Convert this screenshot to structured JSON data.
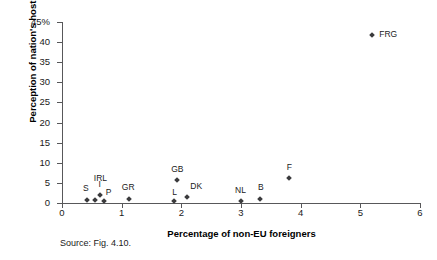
{
  "source_note": "Source: Fig. 4.10.",
  "chart_data": {
    "type": "scatter",
    "title": "",
    "xlabel": "Percentage of non-EU foreigners",
    "ylabel": "Perception of nation's hostility",
    "xlim": [
      0,
      6
    ],
    "ylim": [
      0,
      45
    ],
    "xticks": [
      "0",
      "1",
      "2",
      "3",
      "4",
      "5",
      "6"
    ],
    "yticks": [
      "0",
      "5",
      "10",
      "15",
      "20",
      "25",
      "30",
      "35",
      "40",
      "45%"
    ],
    "grid": false,
    "legend": "none",
    "marker_color": "#3a3a3c",
    "axis_color": "#58585a",
    "points": [
      {
        "label": "S",
        "x": 0.42,
        "y": 0.7,
        "label_dx": -4,
        "label_dy": -16
      },
      {
        "label": "IRL",
        "x": 0.55,
        "y": 0.8,
        "label_dx": -1,
        "label_dy": -26
      },
      {
        "label": "I",
        "x": 0.63,
        "y": 2.0,
        "label_dx": -1,
        "label_dy": -15
      },
      {
        "label": "P",
        "x": 0.7,
        "y": 0.4,
        "label_dx": 2,
        "label_dy": -13
      },
      {
        "label": "GR",
        "x": 1.12,
        "y": 0.9,
        "label_dx": -7,
        "label_dy": -16
      },
      {
        "label": "GB",
        "x": 1.93,
        "y": 5.7,
        "label_dx": -6,
        "label_dy": -15
      },
      {
        "label": "L",
        "x": 1.88,
        "y": 0.5,
        "label_dx": -2,
        "label_dy": -13
      },
      {
        "label": "DK",
        "x": 2.1,
        "y": 1.5,
        "label_dx": 3,
        "label_dy": -15
      },
      {
        "label": "NL",
        "x": 3.0,
        "y": 0.5,
        "label_dx": -6,
        "label_dy": -15
      },
      {
        "label": "B",
        "x": 3.32,
        "y": 1.1,
        "label_dx": -2,
        "label_dy": -16
      },
      {
        "label": "F",
        "x": 3.8,
        "y": 6.3,
        "label_dx": -2,
        "label_dy": -15
      },
      {
        "label": "FRG",
        "x": 5.2,
        "y": 41.8,
        "label_dx": 7,
        "label_dy": -5
      }
    ]
  }
}
